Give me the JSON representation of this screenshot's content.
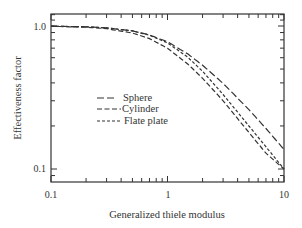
{
  "chart_data": {
    "type": "line",
    "title": "",
    "xlabel": "Generalized thiele modulus",
    "ylabel": "Effectiveness factor",
    "xscale": "log",
    "yscale": "log",
    "xlim": [
      0.1,
      10
    ],
    "ylim": [
      0.08,
      1.2
    ],
    "xticks": [
      {
        "value": 0.1,
        "label": "0.1"
      },
      {
        "value": 1,
        "label": "1"
      },
      {
        "value": 10,
        "label": "10"
      }
    ],
    "yticks": [
      {
        "value": 0.1,
        "label": "0.1"
      },
      {
        "value": 1.0,
        "label": "1.0"
      }
    ],
    "grid": false,
    "legend_position": "center-left inside plot",
    "series": [
      {
        "name": "Sphere",
        "dash": "long",
        "x": [
          0.1,
          0.2,
          0.3,
          0.5,
          0.7,
          1.0,
          1.5,
          2,
          3,
          5,
          7,
          10
        ],
        "y": [
          0.997,
          0.987,
          0.971,
          0.925,
          0.866,
          0.776,
          0.636,
          0.532,
          0.397,
          0.26,
          0.192,
          0.137
        ]
      },
      {
        "name": "Cylinder",
        "dash": "medium",
        "x": [
          0.1,
          0.2,
          0.3,
          0.5,
          0.7,
          1.0,
          1.5,
          2,
          3,
          5,
          7,
          10
        ],
        "y": [
          0.995,
          0.981,
          0.958,
          0.893,
          0.816,
          0.7,
          0.54,
          0.431,
          0.3,
          0.18,
          0.129,
          0.1
        ]
      },
      {
        "name": "Flate plate",
        "dash": "short",
        "x": [
          0.1,
          0.2,
          0.3,
          0.5,
          0.7,
          1.0,
          1.5,
          2,
          3,
          5,
          7,
          10
        ],
        "y": [
          0.997,
          0.987,
          0.971,
          0.924,
          0.862,
          0.762,
          0.603,
          0.482,
          0.332,
          0.2,
          0.143,
          0.1
        ]
      }
    ]
  },
  "axes": {
    "x_title": "Generalized thiele modulus",
    "y_title": "Effectiveness factor",
    "x_tick_labels": [
      "0.1",
      "1",
      "10"
    ],
    "y_tick_labels": [
      "1.0",
      "0.1"
    ]
  },
  "legend": {
    "items": [
      {
        "label": "Sphere"
      },
      {
        "label": "Cylinder"
      },
      {
        "label": "Flate plate"
      }
    ]
  }
}
